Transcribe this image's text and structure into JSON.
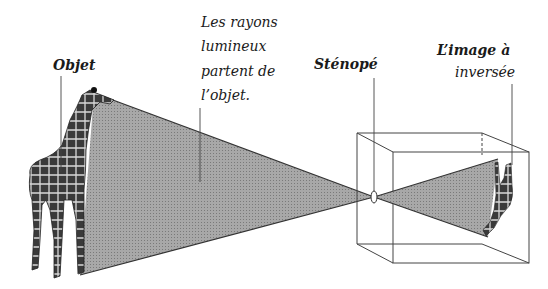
{
  "diagram": {
    "labels": {
      "objet": "Objet",
      "rayons": [
        "Les rayons",
        "lumineux",
        "partent de",
        "l’objet."
      ],
      "stenope": "Sténopé",
      "image": [
        "L’image à",
        "inversée"
      ]
    },
    "colors": {
      "cone_fill": "#9a9a9a",
      "line": "#333333",
      "text": "#1a1a1a",
      "background": "#ffffff"
    },
    "elements": {
      "object": "giraffe",
      "pinhole": "small aperture in box front face",
      "box": "wireframe camera obscura box",
      "image": "inverted giraffe on back wall"
    }
  }
}
